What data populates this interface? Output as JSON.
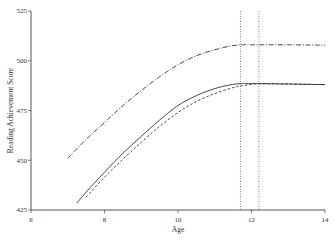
{
  "chart_data": {
    "type": "line",
    "title": "",
    "xlabel": "Age",
    "ylabel": "Reading Achievement Score",
    "xlim": [
      6,
      14
    ],
    "ylim": [
      425,
      525
    ],
    "xticks": [
      6,
      8,
      10,
      12,
      14
    ],
    "yticks": [
      425,
      450,
      475,
      500,
      525
    ],
    "xtick_labels": [
      "6",
      "8",
      "10",
      "12",
      "14"
    ],
    "ytick_labels": [
      "425",
      "450",
      "475",
      "500",
      "525"
    ],
    "grid": false,
    "legend": null,
    "vertical_lines": [
      11.7,
      12.2
    ],
    "series": [
      {
        "name": "upper-dash-dot",
        "style": "dashdot",
        "x": [
          7.0,
          7.5,
          8.0,
          8.5,
          9.0,
          9.5,
          10.0,
          10.5,
          11.0,
          11.4,
          11.7,
          12.0,
          13.0,
          14.0
        ],
        "y": [
          451,
          460.5,
          469,
          477.5,
          485,
          492,
          498,
          502.5,
          505.5,
          507.3,
          508,
          508,
          508,
          507.8
        ]
      },
      {
        "name": "solid",
        "style": "solid",
        "x": [
          7.25,
          7.5,
          8.0,
          8.5,
          9.0,
          9.5,
          10.0,
          10.5,
          11.0,
          11.4,
          11.7,
          12.0,
          13.0,
          14.0
        ],
        "y": [
          428.5,
          434,
          444,
          453.5,
          462,
          470.2,
          477.5,
          482.5,
          486,
          487.8,
          488.5,
          488.5,
          488.3,
          488
        ],
        "_note": ""
      },
      {
        "name": "dashed",
        "style": "dashed",
        "x": [
          7.5,
          8.0,
          8.5,
          9.0,
          9.5,
          10.0,
          10.5,
          11.0,
          11.5,
          11.7,
          12.2,
          13.0,
          14.0
        ],
        "y": [
          431.5,
          441.5,
          450.5,
          459,
          467,
          474,
          479.5,
          483.5,
          486.5,
          487.3,
          488.5,
          488.3,
          488
        ]
      }
    ]
  }
}
